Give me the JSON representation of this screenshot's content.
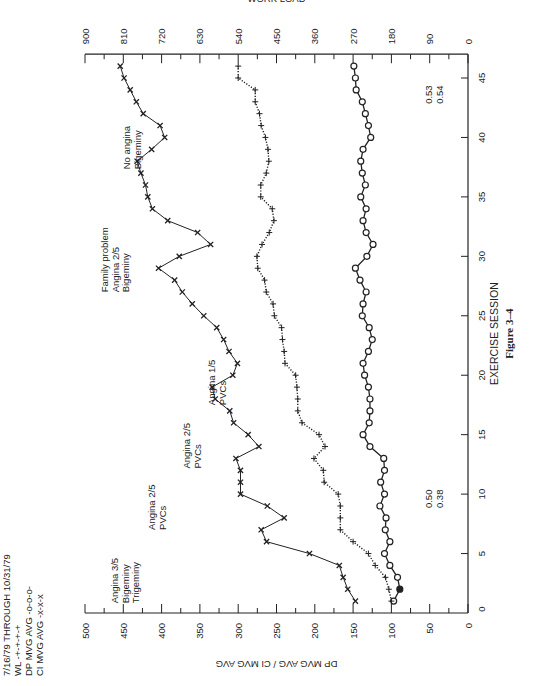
{
  "chart_data": {
    "type": "line",
    "orientation_note": "page rotated 90 degrees counter-clockwise",
    "date_range": "7/16/79 THROUGH 10/31/79",
    "xlabel": "EXERCISE SESSION",
    "ylabel_left": "DP MVG AVG  /  CI MVG AVG",
    "ylabel_right": "WORK LOAD",
    "ylabel_right_units": "kpm • min⁻¹",
    "x_ticks": [
      5,
      10,
      15,
      20,
      25,
      30,
      35,
      40,
      45
    ],
    "xlim": [
      0,
      47
    ],
    "y_left_ticks": [
      0,
      50,
      100,
      150,
      200,
      250,
      300,
      350,
      400,
      450,
      500
    ],
    "ylim_left": [
      0,
      500
    ],
    "y_right_ticks": [
      0,
      90,
      180,
      270,
      360,
      450,
      540,
      630,
      720,
      810,
      900
    ],
    "ylim_right": [
      0,
      900
    ],
    "grid": false,
    "legend": [
      {
        "label": "WL",
        "marker": "+",
        "line": "dotted"
      },
      {
        "label": "DP MVG AVG",
        "marker": "o",
        "line": "solid"
      },
      {
        "label": "CI MVG AVG",
        "marker": "x",
        "line": "solid"
      }
    ],
    "x": [
      1,
      2,
      3,
      4,
      5,
      6,
      7,
      8,
      9,
      10,
      11,
      12,
      13,
      14,
      15,
      16,
      17,
      18,
      19,
      20,
      21,
      22,
      23,
      24,
      25,
      26,
      27,
      28,
      29,
      30,
      31,
      32,
      33,
      34,
      35,
      36,
      37,
      38,
      39,
      40,
      41,
      42,
      43,
      44,
      45,
      46
    ],
    "series": [
      {
        "name": "CI MVG AVG",
        "axis": "left",
        "marker": "x",
        "values": [
          147,
          157,
          163,
          168,
          207,
          263,
          270,
          240,
          262,
          297,
          297,
          297,
          303,
          273,
          287,
          306,
          311,
          330,
          334,
          307,
          301,
          312,
          319,
          328,
          345,
          360,
          373,
          383,
          404,
          377,
          336,
          353,
          392,
          412,
          418,
          421,
          427,
          432,
          413,
          396,
          402,
          424,
          433,
          441,
          449,
          454
        ]
      },
      {
        "name": "DP MVG AVG",
        "axis": "left",
        "marker": "o",
        "values": [
          97,
          89,
          92,
          102,
          109,
          102,
          108,
          107,
          115,
          109,
          114,
          109,
          110,
          128,
          137,
          129,
          128,
          128,
          130,
          135,
          137,
          130,
          125,
          129,
          138,
          137,
          133,
          141,
          147,
          132,
          124,
          133,
          137,
          133,
          140,
          134,
          138,
          140,
          137,
          127,
          130,
          134,
          138,
          146,
          147,
          149
        ]
      },
      {
        "name": "WL",
        "axis": "right",
        "marker": "+",
        "values": [
          180,
          186,
          194,
          218,
          234,
          270,
          300,
          300,
          300,
          305,
          338,
          340,
          362,
          336,
          350,
          390,
          400,
          400,
          402,
          405,
          430,
          432,
          436,
          438,
          455,
          458,
          474,
          478,
          494,
          496,
          484,
          467,
          456,
          460,
          487,
          487,
          474,
          468,
          470,
          476,
          486,
          490,
          500,
          500,
          540,
          540
        ]
      }
    ],
    "annotations": [
      {
        "session": 2.5,
        "text": [
          "Angina 3/5",
          "Bigeminy",
          "Trigeminy"
        ]
      },
      {
        "session": 9,
        "text": [
          "Angina 2/5",
          "PVCs"
        ]
      },
      {
        "session": 14,
        "text": [
          "Angina 2/5",
          "PVCs"
        ]
      },
      {
        "session": 19.5,
        "text": [
          "Angina 1/5",
          "PVCs"
        ]
      },
      {
        "session": 31,
        "text": [
          "Family problem",
          "Angina 2/5",
          "Bigeminy"
        ]
      },
      {
        "session": 39.5,
        "text": [
          "No angina",
          "Bigeminy"
        ]
      },
      {
        "session": 10,
        "text": [
          "0.50",
          "0.38"
        ],
        "near": "x-axis"
      },
      {
        "session": 44,
        "text": [
          "0.53",
          "0.54"
        ],
        "near": "x-axis"
      }
    ]
  },
  "legend_lines": [
    "7/16/79 THROUGH 10/31/79",
    "WL -+-+-+-+",
    "DP MVG AVG -o-o-o-",
    "CI MVG AVG -x-x-x"
  ],
  "figure_caption": "Figure 3–4"
}
